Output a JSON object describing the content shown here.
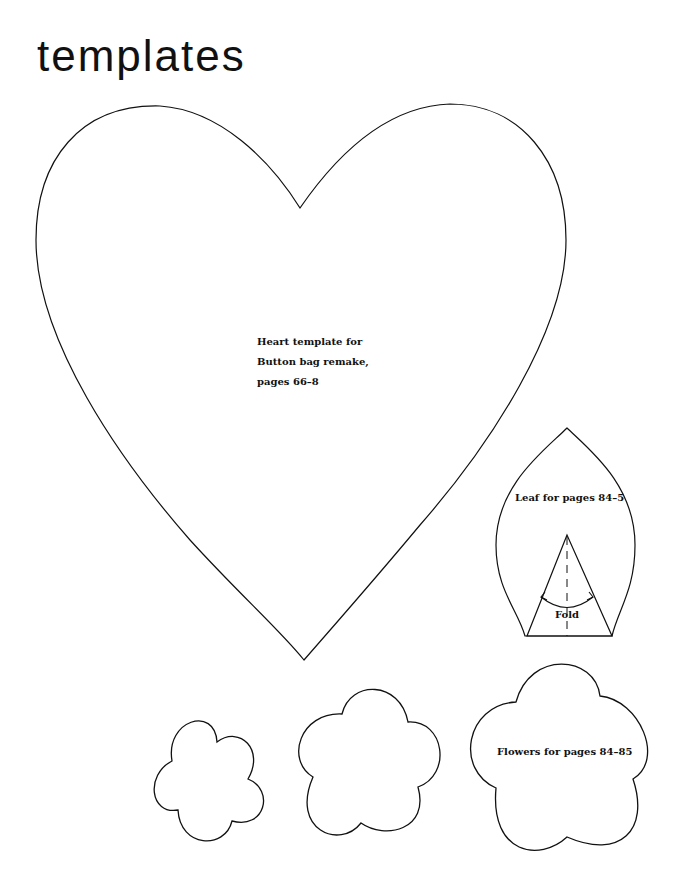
{
  "page": {
    "title": "templates"
  },
  "templates": {
    "heart": {
      "label_lines": [
        "Heart template for",
        "Button bag remake,",
        "pages 66–8"
      ]
    },
    "leaf": {
      "label": "Leaf for pages 84–5",
      "fold_label": "Fold"
    },
    "flowers": {
      "label": "Flowers for pages 84–85",
      "count": 3
    }
  },
  "colors": {
    "stroke": "#111111",
    "background": "#ffffff"
  }
}
